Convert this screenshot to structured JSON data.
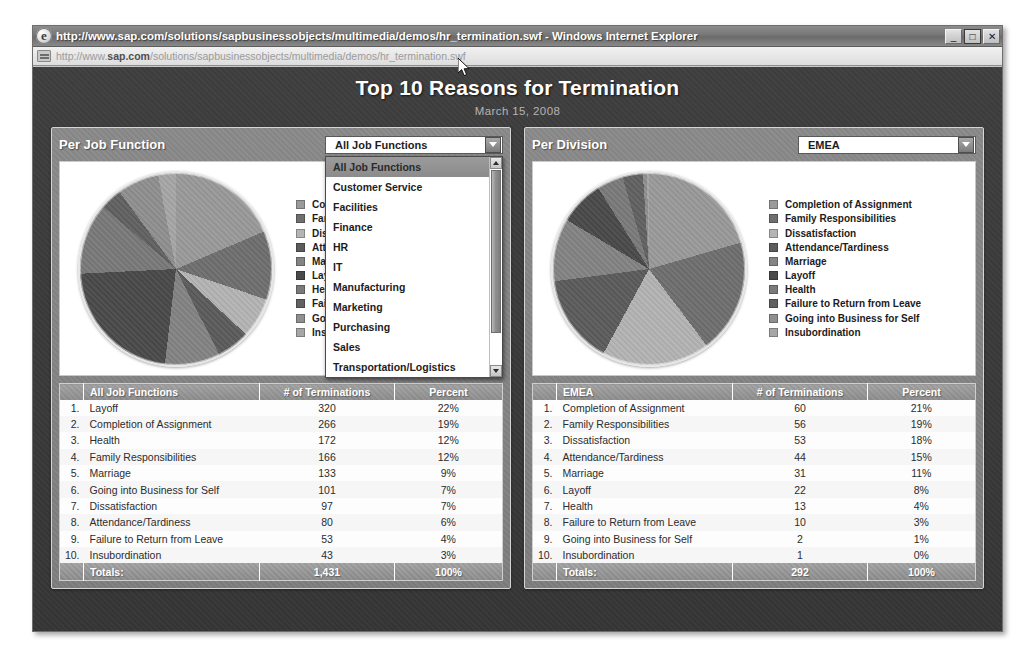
{
  "window": {
    "title": "http://www.sap.com/solutions/sapbusinessobjects/multimedia/demos/hr_termination.swf - Windows Internet Explorer",
    "minimize_label": "_",
    "maximize_label": "□",
    "close_label": "✕",
    "address_prefix": "http://www.",
    "address_host": "sap.com",
    "address_suffix": "/solutions/sapbusinessobjects/multimedia/demos/hr_termination.swf"
  },
  "app": {
    "title": "Top 10 Reasons for Termination",
    "subtitle": "March 15, 2008"
  },
  "left_panel": {
    "title": "Per Job Function",
    "selected": "All Job Functions",
    "dropdown_open": true,
    "options": [
      "All Job Functions",
      "Customer Service",
      "Facilities",
      "Finance",
      "HR",
      "IT",
      "Manufacturing",
      "Marketing",
      "Purchasing",
      "Sales",
      "Transportation/Logistics"
    ],
    "columns": [
      "",
      "All Job Functions",
      "# of Terminations",
      "Percent"
    ],
    "rows": [
      {
        "num": "1.",
        "reason": "Layoff",
        "count": "320",
        "percent": "22%"
      },
      {
        "num": "2.",
        "reason": "Completion of Assignment",
        "count": "266",
        "percent": "19%"
      },
      {
        "num": "3.",
        "reason": "Health",
        "count": "172",
        "percent": "12%"
      },
      {
        "num": "4.",
        "reason": "Family Responsibilities",
        "count": "166",
        "percent": "12%"
      },
      {
        "num": "5.",
        "reason": "Marriage",
        "count": "133",
        "percent": "9%"
      },
      {
        "num": "6.",
        "reason": "Going into Business for Self",
        "count": "101",
        "percent": "7%"
      },
      {
        "num": "7.",
        "reason": "Dissatisfaction",
        "count": "97",
        "percent": "7%"
      },
      {
        "num": "8.",
        "reason": "Attendance/Tardiness",
        "count": "80",
        "percent": "6%"
      },
      {
        "num": "9.",
        "reason": "Failure to Return from Leave",
        "count": "53",
        "percent": "4%"
      },
      {
        "num": "10.",
        "reason": "Insubordination",
        "count": "43",
        "percent": "3%"
      }
    ],
    "totals": {
      "label": "Totals:",
      "count": "1,431",
      "percent": "100%"
    },
    "legend": [
      "Completion of Assignment",
      "Family Responsibilities",
      "Dissatisfaction",
      "Attendance/Tardiness",
      "Marriage",
      "Layoff",
      "Health",
      "Failure to Return from Leave",
      "Going into Business for Self",
      "Insubordination"
    ]
  },
  "right_panel": {
    "title": "Per Division",
    "selected": "EMEA",
    "dropdown_open": false,
    "options": [
      "EMEA"
    ],
    "columns": [
      "",
      "EMEA",
      "# of Terminations",
      "Percent"
    ],
    "rows": [
      {
        "num": "1.",
        "reason": "Completion of Assignment",
        "count": "60",
        "percent": "21%"
      },
      {
        "num": "2.",
        "reason": "Family Responsibilities",
        "count": "56",
        "percent": "19%"
      },
      {
        "num": "3.",
        "reason": "Dissatisfaction",
        "count": "53",
        "percent": "18%"
      },
      {
        "num": "4.",
        "reason": "Attendance/Tardiness",
        "count": "44",
        "percent": "15%"
      },
      {
        "num": "5.",
        "reason": "Marriage",
        "count": "31",
        "percent": "11%"
      },
      {
        "num": "6.",
        "reason": "Layoff",
        "count": "22",
        "percent": "8%"
      },
      {
        "num": "7.",
        "reason": "Health",
        "count": "13",
        "percent": "4%"
      },
      {
        "num": "8.",
        "reason": "Failure to Return from Leave",
        "count": "10",
        "percent": "3%"
      },
      {
        "num": "9.",
        "reason": "Going into Business for Self",
        "count": "2",
        "percent": "1%"
      },
      {
        "num": "10.",
        "reason": "Insubordination",
        "count": "1",
        "percent": "0%"
      }
    ],
    "totals": {
      "label": "Totals:",
      "count": "292",
      "percent": "100%"
    },
    "legend": [
      "Completion of Assignment",
      "Family Responsibilities",
      "Dissatisfaction",
      "Attendance/Tardiness",
      "Marriage",
      "Layoff",
      "Health",
      "Failure to Return from Leave",
      "Going into Business for Self",
      "Insubordination"
    ]
  },
  "palette": [
    "#9a9a9a",
    "#6f6f6f",
    "#b4b4b4",
    "#5c5c5c",
    "#848484",
    "#4a4a4a",
    "#7a7a7a",
    "#616161",
    "#8f8f8f",
    "#a6a6a6"
  ],
  "chart_data": [
    {
      "type": "pie",
      "title": "Per Job Function — All Job Functions",
      "labels": [
        "Layoff",
        "Completion of Assignment",
        "Health",
        "Family Responsibilities",
        "Marriage",
        "Going into Business for Self",
        "Dissatisfaction",
        "Attendance/Tardiness",
        "Failure to Return from Leave",
        "Insubordination"
      ],
      "values": [
        320,
        266,
        172,
        166,
        133,
        101,
        97,
        80,
        53,
        43
      ],
      "percents": [
        22,
        19,
        12,
        12,
        9,
        7,
        7,
        6,
        4,
        3
      ],
      "total": 1431,
      "legend_position": "right",
      "legend_order": [
        "Completion of Assignment",
        "Family Responsibilities",
        "Dissatisfaction",
        "Attendance/Tardiness",
        "Marriage",
        "Layoff",
        "Health",
        "Failure to Return from Leave",
        "Going into Business for Self",
        "Insubordination"
      ]
    },
    {
      "type": "pie",
      "title": "Per Division — EMEA",
      "labels": [
        "Completion of Assignment",
        "Family Responsibilities",
        "Dissatisfaction",
        "Attendance/Tardiness",
        "Marriage",
        "Layoff",
        "Health",
        "Failure to Return from Leave",
        "Going into Business for Self",
        "Insubordination"
      ],
      "values": [
        60,
        56,
        53,
        44,
        31,
        22,
        13,
        10,
        2,
        1
      ],
      "percents": [
        21,
        19,
        18,
        15,
        11,
        8,
        4,
        3,
        1,
        0
      ],
      "total": 292,
      "legend_position": "right",
      "legend_order": [
        "Completion of Assignment",
        "Family Responsibilities",
        "Dissatisfaction",
        "Attendance/Tardiness",
        "Marriage",
        "Layoff",
        "Health",
        "Failure to Return from Leave",
        "Going into Business for Self",
        "Insubordination"
      ]
    }
  ]
}
